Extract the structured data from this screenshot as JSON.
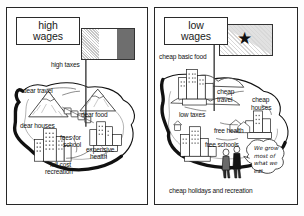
{
  "document": {
    "type": "educational-comparison-diagram",
    "description": "Two-panel cartoon comparing a high wage economy and a low wage economy"
  },
  "panels": [
    {
      "id": "high-wages",
      "title_line1": "high",
      "title_line2": "wages",
      "flag": {
        "name": "tricolour-flag",
        "bands": [
          "#b8b8b8",
          "#ffffff",
          "#6e6e6e"
        ]
      },
      "labels": [
        {
          "key": "high_taxes",
          "text": "high taxes"
        },
        {
          "key": "dear_travel",
          "text": "dear travel"
        },
        {
          "key": "dear_food",
          "text": "dear food"
        },
        {
          "key": "dear_houses",
          "text": "dear houses"
        },
        {
          "key": "fees_for_school_1",
          "text": "fees for"
        },
        {
          "key": "fees_for_school_2",
          "text": "school"
        },
        {
          "key": "expensive_health_1",
          "text": "expensive"
        },
        {
          "key": "expensive_health_2",
          "text": "health"
        },
        {
          "key": "full_cost_rec_1",
          "text": "full cost"
        },
        {
          "key": "full_cost_rec_2",
          "text": "recreation"
        }
      ]
    },
    {
      "id": "low-wages",
      "title_line1": "low",
      "title_line2": "wages",
      "flag": {
        "name": "star-flag",
        "star": "★",
        "field": "#ffffff",
        "corner": "#bdbdbd"
      },
      "labels": [
        {
          "key": "cheap_basic_food",
          "text": "cheap basic food"
        },
        {
          "key": "cheap_travel_1",
          "text": "cheap"
        },
        {
          "key": "cheap_travel_2",
          "text": "travel"
        },
        {
          "key": "cheap_houses_1",
          "text": "cheap"
        },
        {
          "key": "cheap_houses_2",
          "text": "houses"
        },
        {
          "key": "low_taxes",
          "text": "low taxes"
        },
        {
          "key": "free_health",
          "text": "free health"
        },
        {
          "key": "free_schools",
          "text": "free schools"
        },
        {
          "key": "cheap_holidays",
          "text": "cheap holidays and recreation"
        }
      ],
      "speech_bubble": {
        "name": "villagers-speech-bubble",
        "text": "We grow most of what we eat."
      }
    }
  ]
}
